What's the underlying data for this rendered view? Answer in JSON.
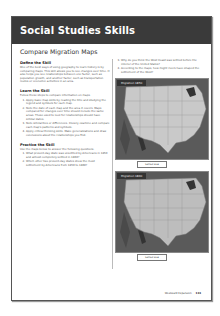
{
  "header": {
    "title": "Social Studies Skills"
  },
  "subtitle": "Compare Migration Maps",
  "left": {
    "define": {
      "heading": "Define the Skill",
      "text": "One of the best ways of using geography to learn history is by comparing maps. This skill allows you to see changes over time. It also helps you see relationships between one factor, such as population growth, and another factor, such as transportation routes or economic activities in an area."
    },
    "learn": {
      "heading": "Learn the Skill",
      "intro": "Follow these steps to compare information on maps.",
      "steps": [
        "Apply basic map skills by reading the title and studying the legend and symbols for each map.",
        "Note the date of each map and the area it covers. Maps compared for changes over time should include the same areas. Those used to look for relationships should have similar dates.",
        "Note similarities or differences. Closely examine and compare each map's patterns and symbols.",
        "Apply critical thinking skills. Make generalizations and draw conclusions about the relationships you find."
      ]
    },
    "practice": {
      "heading": "Practice the Skill",
      "intro": "Use the maps below to answer the following questions.",
      "questions": [
        "What present-day state was unsettled by Americans in 1850 and almost completely settled in 1860?",
        "Which other two present-day states show the most settlement by Americans from 1850 to 1860?"
      ]
    }
  },
  "right": {
    "questions": [
      {
        "num": "3.",
        "text": "Why do you think the West Coast was settled before the interior of the United States?"
      },
      {
        "num": "4.",
        "text": "According to the maps, how might rivers have shaped the settlement of the West?"
      }
    ],
    "maps": [
      {
        "title": "Migration 1850",
        "legend": "Settled area"
      },
      {
        "title": "Migration 1860",
        "legend": "Settled area"
      }
    ]
  },
  "footer": {
    "section": "Westward Expansion",
    "page": "133"
  }
}
